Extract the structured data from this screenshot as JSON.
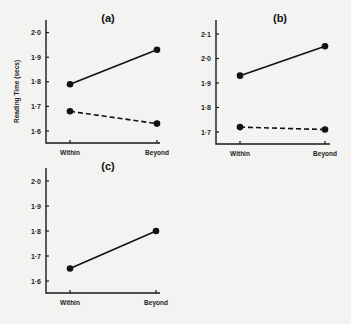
{
  "chart_data": [
    {
      "type": "line",
      "panel": "(a)",
      "categories": [
        "Within",
        "Beyond"
      ],
      "ylabel": "Reading Time (secs)",
      "yticks": [
        "1·6",
        "1·7",
        "1·8",
        "1·9",
        "2·0"
      ],
      "ylim": [
        1.55,
        2.05
      ],
      "series": [
        {
          "name": "solid",
          "style": "solid",
          "values": [
            1.79,
            1.93
          ]
        },
        {
          "name": "dashed",
          "style": "dashed",
          "values": [
            1.68,
            1.63
          ]
        }
      ]
    },
    {
      "type": "line",
      "panel": "(b)",
      "categories": [
        "Within",
        "Beyond"
      ],
      "ylabel": "",
      "yticks": [
        "1·7",
        "1·8",
        "1·9",
        "2·0",
        "2·1"
      ],
      "ylim": [
        1.65,
        2.15
      ],
      "series": [
        {
          "name": "solid",
          "style": "solid",
          "values": [
            1.93,
            2.05
          ]
        },
        {
          "name": "dashed",
          "style": "dashed",
          "values": [
            1.72,
            1.71
          ]
        }
      ]
    },
    {
      "type": "line",
      "panel": "(c)",
      "categories": [
        "Within",
        "Beyond"
      ],
      "ylabel": "",
      "yticks": [
        "1·6",
        "1·7",
        "1·8",
        "1·9",
        "2·0"
      ],
      "ylim": [
        1.55,
        2.05
      ],
      "series": [
        {
          "name": "solid",
          "style": "solid",
          "values": [
            1.65,
            1.8
          ]
        }
      ]
    }
  ]
}
